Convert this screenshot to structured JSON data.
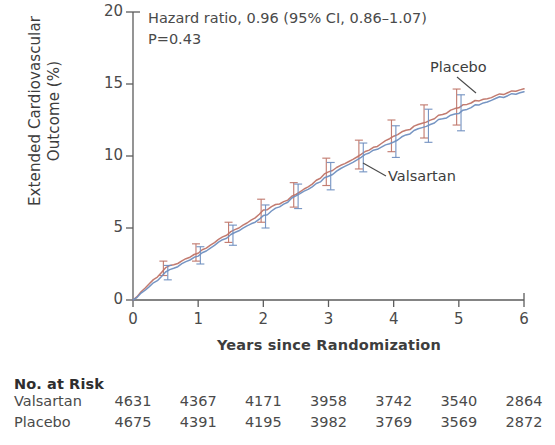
{
  "chart_data": {
    "type": "line",
    "title": "",
    "xlabel": "Years since Randomization",
    "ylabel_line1": "Extended Cardiovascular",
    "ylabel_line2": "Outcome (%)",
    "xlim": [
      0,
      6
    ],
    "ylim": [
      0,
      20
    ],
    "xticks": [
      "0",
      "1",
      "2",
      "3",
      "4",
      "5",
      "6"
    ],
    "yticks": [
      "0",
      "5",
      "10",
      "15",
      "20"
    ],
    "grid": false,
    "legend_position": "inline-annotation",
    "annotations": {
      "hazard_ratio": "Hazard ratio, 0.96 (95% CI, 0.86–1.07)",
      "p_value": "P=0.43"
    },
    "series": [
      {
        "name": "Placebo",
        "color": "#bf7468",
        "x": [
          0,
          0.25,
          0.5,
          0.75,
          1.0,
          1.25,
          1.5,
          1.75,
          2.0,
          2.25,
          2.5,
          2.75,
          3.0,
          3.25,
          3.5,
          3.75,
          4.0,
          4.25,
          4.5,
          4.75,
          5.0,
          5.25,
          5.5,
          5.75,
          6.0
        ],
        "values": [
          0.0,
          1.1,
          2.2,
          2.7,
          3.3,
          4.0,
          4.7,
          5.3,
          6.2,
          6.7,
          7.3,
          8.1,
          8.9,
          9.5,
          10.1,
          10.7,
          11.4,
          11.9,
          12.4,
          12.9,
          13.4,
          13.8,
          14.1,
          14.4,
          14.7
        ],
        "error_bar_x": [
          0.5,
          1.0,
          1.5,
          2.0,
          2.5,
          3.0,
          3.5,
          4.0,
          4.5,
          5.0
        ],
        "error_bar_values": [
          2.2,
          3.3,
          4.7,
          6.2,
          7.3,
          8.9,
          10.1,
          11.4,
          12.4,
          13.4
        ],
        "error_bar_halfwidth": [
          0.5,
          0.6,
          0.7,
          0.8,
          0.85,
          0.95,
          1.0,
          1.1,
          1.15,
          1.25
        ]
      },
      {
        "name": "Valsartan",
        "color": "#6f8fc0",
        "x": [
          0,
          0.25,
          0.5,
          0.75,
          1.0,
          1.25,
          1.5,
          1.75,
          2.0,
          2.25,
          2.5,
          2.75,
          3.0,
          3.25,
          3.5,
          3.75,
          4.0,
          4.25,
          4.5,
          4.75,
          5.0,
          5.25,
          5.5,
          5.75,
          6.0
        ],
        "values": [
          0.0,
          0.9,
          1.9,
          2.5,
          3.1,
          3.8,
          4.5,
          5.1,
          5.8,
          6.5,
          7.2,
          7.9,
          8.6,
          9.3,
          9.9,
          10.5,
          11.0,
          11.6,
          12.1,
          12.6,
          13.0,
          13.5,
          13.9,
          14.2,
          14.5
        ],
        "error_bar_x": [
          0.5,
          1.0,
          1.5,
          2.0,
          2.5,
          3.0,
          3.5,
          4.0,
          4.5,
          5.0
        ],
        "error_bar_values": [
          1.9,
          3.1,
          4.5,
          5.8,
          7.2,
          8.6,
          9.9,
          11.0,
          12.1,
          13.0
        ],
        "error_bar_halfwidth": [
          0.5,
          0.6,
          0.7,
          0.8,
          0.85,
          0.95,
          1.0,
          1.1,
          1.15,
          1.25
        ]
      }
    ],
    "curve_labels": [
      {
        "text": "Placebo",
        "target_series": "Placebo"
      },
      {
        "text": "Valsartan",
        "target_series": "Valsartan"
      }
    ]
  },
  "risk_table": {
    "title": "No. at Risk",
    "rows": [
      {
        "label": "Valsartan",
        "values": [
          "4631",
          "4367",
          "4171",
          "3958",
          "3742",
          "3540",
          "2864"
        ]
      },
      {
        "label": "Placebo",
        "values": [
          "4675",
          "4391",
          "4195",
          "3982",
          "3769",
          "3569",
          "2872"
        ]
      }
    ]
  },
  "colors": {
    "placebo": "#bf7468",
    "valsartan": "#6f8fc0",
    "axis": "#5c5c5c",
    "text": "#3d3d3d"
  }
}
